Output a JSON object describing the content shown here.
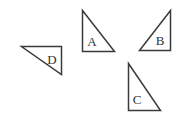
{
  "figure": {
    "canvas": {
      "width": 179,
      "height": 119,
      "background": "#ffffff"
    },
    "stroke_color": "#3b3b3b",
    "label_color": "#333333",
    "stroke_width": 1.5,
    "shapes": [
      {
        "id": "triangle-a",
        "label": "A",
        "points": "82.5,10.5 82.5,51.5 114.5,51.5",
        "label_x": 92,
        "label_y": 46,
        "right_angle_corner": "bottom-left",
        "orientation": "vertical-left-edge hypotenuse-top-left-to-bottom-right"
      },
      {
        "id": "triangle-b",
        "label": "B",
        "points": "170.5,10.5 170.5,50.5 139.5,50.5",
        "label_x": 160,
        "label_y": 45,
        "right_angle_corner": "bottom-right",
        "orientation": "vertical-right-edge hypotenuse-top-right-to-bottom-left"
      },
      {
        "id": "triangle-c",
        "label": "C",
        "points": "128.5,63.5 128.5,110.5 160.5,110.5",
        "label_x": 137,
        "label_y": 104,
        "right_angle_corner": "bottom-left",
        "orientation": "vertical-left-edge hypotenuse-top-left-to-bottom-right"
      },
      {
        "id": "triangle-d",
        "label": "D",
        "points": "21.5,46.5 61.5,46.5 61.5,74.5",
        "label_x": 52,
        "label_y": 64,
        "right_angle_corner": "top-right",
        "orientation": "horizontal-top-edge vertical-right-edge hypotenuse-left-to-bottom-right"
      }
    ]
  }
}
